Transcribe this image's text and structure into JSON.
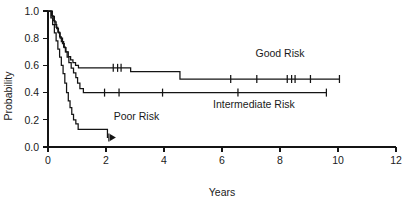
{
  "chart_data": {
    "type": "line",
    "subtype": "kaplan-meier-survival",
    "title": "",
    "xlabel": "Years",
    "ylabel": "Probability",
    "xlim": [
      0,
      12
    ],
    "ylim": [
      0.0,
      1.0
    ],
    "grid": false,
    "legend_position": "inline-annotations",
    "x_ticks": [
      0,
      2,
      4,
      6,
      8,
      10,
      12
    ],
    "x_tick_labels": [
      "0",
      "2",
      "4",
      "6",
      "8",
      "10",
      "12"
    ],
    "y_ticks": [
      0.0,
      0.2,
      0.4,
      0.6,
      0.8,
      1.0
    ],
    "y_tick_labels": [
      "0.0",
      "0.2",
      "0.4",
      "0.6",
      "0.8",
      "1.0"
    ],
    "series": [
      {
        "name": "Good Risk",
        "label": "Good Risk",
        "color": "#141414",
        "label_x": 8.0,
        "label_y": 0.665,
        "steps": [
          [
            0.0,
            1.0
          ],
          [
            0.12,
            0.965
          ],
          [
            0.18,
            0.93
          ],
          [
            0.24,
            0.9
          ],
          [
            0.3,
            0.87
          ],
          [
            0.36,
            0.84
          ],
          [
            0.42,
            0.8
          ],
          [
            0.5,
            0.76
          ],
          [
            0.56,
            0.73
          ],
          [
            0.62,
            0.7
          ],
          [
            0.7,
            0.665
          ],
          [
            0.78,
            0.64
          ],
          [
            0.86,
            0.62
          ],
          [
            0.95,
            0.6
          ],
          [
            1.05,
            0.582
          ],
          [
            2.85,
            0.555
          ],
          [
            4.55,
            0.5
          ],
          [
            10.05,
            0.5
          ]
        ],
        "censor_times": [
          2.25,
          2.4,
          2.52,
          6.3,
          7.2,
          8.25,
          8.4,
          8.52,
          9.05,
          10.05
        ],
        "censor_probabilities": [
          0.582,
          0.582,
          0.582,
          0.5,
          0.5,
          0.5,
          0.5,
          0.5,
          0.5,
          0.5
        ],
        "final_time": 10.05,
        "final_probability": 0.5
      },
      {
        "name": "Intermediate Risk",
        "label": "Intermediate Risk",
        "color": "#141414",
        "label_x": 7.1,
        "label_y": 0.285,
        "steps": [
          [
            0.0,
            1.0
          ],
          [
            0.15,
            0.96
          ],
          [
            0.22,
            0.92
          ],
          [
            0.28,
            0.88
          ],
          [
            0.34,
            0.845
          ],
          [
            0.4,
            0.81
          ],
          [
            0.46,
            0.775
          ],
          [
            0.54,
            0.735
          ],
          [
            0.6,
            0.7
          ],
          [
            0.66,
            0.66
          ],
          [
            0.72,
            0.62
          ],
          [
            0.8,
            0.58
          ],
          [
            0.88,
            0.545
          ],
          [
            0.96,
            0.51
          ],
          [
            1.02,
            0.47
          ],
          [
            1.1,
            0.43
          ],
          [
            1.22,
            0.4
          ],
          [
            9.6,
            0.4
          ]
        ],
        "censor_times": [
          1.95,
          2.45,
          3.95,
          6.55,
          9.6
        ],
        "censor_probabilities": [
          0.4,
          0.4,
          0.4,
          0.4,
          0.4
        ],
        "final_time": 9.6,
        "final_probability": 0.4
      },
      {
        "name": "Poor Risk",
        "label": "Poor Risk",
        "color": "#141414",
        "label_x": 3.05,
        "label_y": 0.195,
        "steps": [
          [
            0.0,
            1.0
          ],
          [
            0.1,
            0.95
          ],
          [
            0.16,
            0.9
          ],
          [
            0.22,
            0.84
          ],
          [
            0.28,
            0.78
          ],
          [
            0.34,
            0.72
          ],
          [
            0.4,
            0.66
          ],
          [
            0.46,
            0.6
          ],
          [
            0.52,
            0.54
          ],
          [
            0.58,
            0.47
          ],
          [
            0.64,
            0.4
          ],
          [
            0.7,
            0.34
          ],
          [
            0.76,
            0.29
          ],
          [
            0.82,
            0.24
          ],
          [
            0.88,
            0.2
          ],
          [
            0.96,
            0.17
          ],
          [
            1.04,
            0.13
          ],
          [
            2.05,
            0.13
          ],
          [
            2.05,
            0.07
          ],
          [
            2.08,
            0.07
          ]
        ],
        "censor_times": [
          2.1
        ],
        "censor_probabilities": [
          0.07
        ],
        "final_time": 2.1,
        "final_probability": 0.07,
        "terminal_arrow": true
      }
    ]
  },
  "axes": {
    "x_title": "Years",
    "y_title": "Probability"
  },
  "colors": {
    "ink": "#141414",
    "background": "#ffffff"
  }
}
